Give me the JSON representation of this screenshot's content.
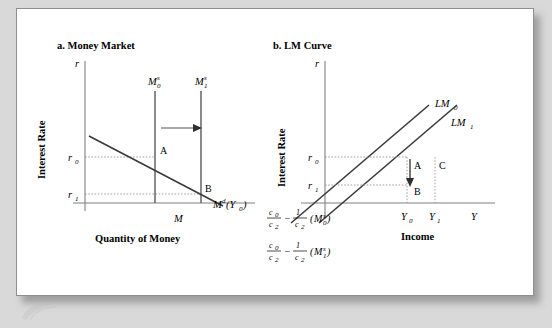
{
  "figure": {
    "panel_a": {
      "title": "a. Money Market",
      "y_axis_symbol": "r",
      "y_axis_name": "Interest Rate",
      "x_axis_symbol": "M",
      "x_axis_name": "Quantity of Money",
      "tick_labels": [
        {
          "base": "r",
          "sub": "0"
        },
        {
          "base": "r",
          "sub": "1"
        }
      ],
      "supply_curves": [
        {
          "base": "M",
          "sup": "s",
          "sub": "0"
        },
        {
          "base": "M",
          "sup": "s",
          "sub": "1"
        }
      ],
      "demand_curve": {
        "base": "M",
        "sup": "d",
        "arg": "(Y",
        "arg_sub": "0",
        "arg_close": ")"
      },
      "points": [
        "A",
        "B"
      ],
      "shift_arrow_direction": "right"
    },
    "panel_b": {
      "title": "b. LM Curve",
      "y_axis_symbol": "r",
      "y_axis_name": "Interest Rate",
      "x_axis_symbol": "Y",
      "x_axis_name": "Income",
      "tick_labels": [
        {
          "base": "r",
          "sub": "0"
        },
        {
          "base": "r",
          "sub": "1"
        }
      ],
      "x_tick_labels": [
        {
          "base": "Y",
          "sub": "0"
        },
        {
          "base": "Y",
          "sub": "1"
        }
      ],
      "lm_curves": [
        {
          "base": "LM",
          "sub": "0"
        },
        {
          "base": "LM",
          "sub": "1"
        }
      ],
      "points": [
        "A",
        "C",
        "B"
      ],
      "move_arrow_direction": "down",
      "intercepts": [
        {
          "num1": "c",
          "num1_sub": "0",
          "den1": "c",
          "den1_sub": "2",
          "minus": "−",
          "num2": "1",
          "den2": "c",
          "den2_sub": "2",
          "paren_open": "(",
          "base": "M",
          "sup": "s",
          "sub": "0",
          "paren_close": ")"
        },
        {
          "num1": "c",
          "num1_sub": "0",
          "den1": "c",
          "den1_sub": "2",
          "minus": "−",
          "num2": "1",
          "den2": "c",
          "den2_sub": "2",
          "paren_open": "(",
          "base": "M",
          "sup": "s",
          "sub": "1",
          "paren_close": ")"
        }
      ]
    },
    "colors": {
      "card_background": "#ffffff",
      "page_background": "#d9d9d9",
      "curve": "#3a3a3a",
      "axis": "#808080",
      "dotted_guide": "#9a9a9a"
    }
  }
}
